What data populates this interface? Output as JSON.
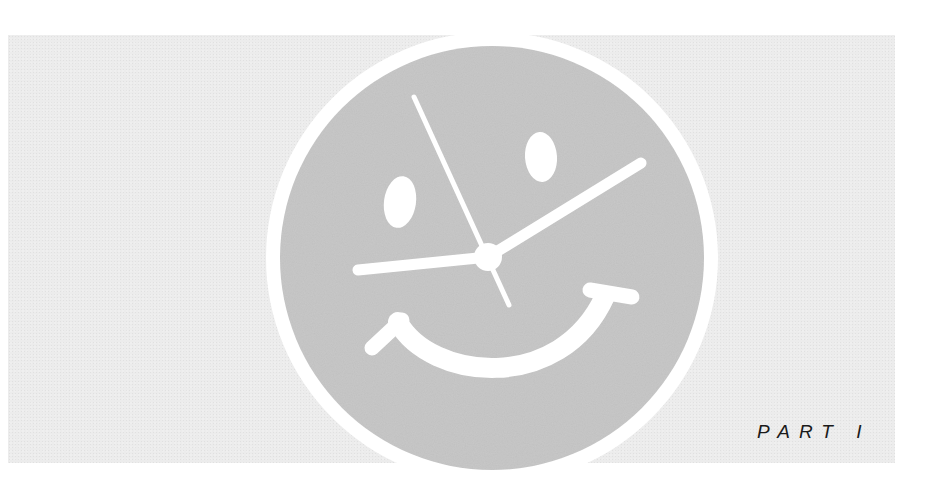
{
  "page": {
    "label": "PART I"
  },
  "illustration": {
    "subject": "smiley-face-clock",
    "colors": {
      "background_band": "#ececec",
      "face_fill": "#c9c9c9",
      "ring": "#ffffff",
      "features": "#ffffff",
      "text": "#1a1a1a"
    }
  }
}
